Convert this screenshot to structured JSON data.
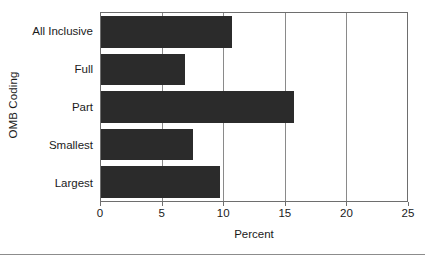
{
  "chart_data": {
    "type": "bar",
    "orientation": "horizontal",
    "title": "",
    "xlabel": "Percent",
    "ylabel": "OMB Coding",
    "categories": [
      "All Inclusive",
      "Full",
      "Part",
      "Smallest",
      "Largest"
    ],
    "values": [
      10.7,
      6.9,
      15.8,
      7.5,
      9.7
    ],
    "xlim": [
      0,
      25
    ],
    "xticks": [
      0,
      5,
      10,
      15,
      20,
      25
    ],
    "xtick_labels": [
      "0",
      "5",
      "10",
      "15",
      "20",
      "25"
    ],
    "gridlines": [
      5,
      10,
      15,
      20
    ],
    "grid": true,
    "legend": false,
    "bar_color": "#2b2b2b",
    "frame_color": "#6e6e6e",
    "grid_color": "#8a8a8a",
    "background": "#ffffff"
  }
}
